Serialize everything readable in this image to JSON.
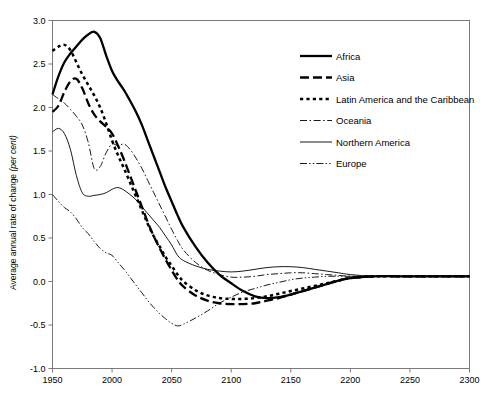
{
  "chart_data": {
    "type": "line",
    "title": "",
    "subtitle": "",
    "xlabel": "",
    "ylabel": "Average annual rate of change (per cent)",
    "ylabel_plain": "Average annual rate of change",
    "ylabel_italic": "(per cent)",
    "xlim": [
      1950,
      2300
    ],
    "ylim": [
      -1.0,
      3.0
    ],
    "grid": false,
    "legend_position": "top-right",
    "x_ticks": [
      1950,
      2000,
      2050,
      2100,
      2150,
      2200,
      2250,
      2300
    ],
    "x_tick_labels": [
      "1950",
      "2000",
      "2050",
      "2100",
      "2150",
      "2200",
      "2250",
      "2300"
    ],
    "y_ticks": [
      -1.0,
      -0.5,
      0.0,
      0.5,
      1.0,
      1.5,
      2.0,
      2.5,
      3.0
    ],
    "y_tick_labels": [
      "-1.0",
      "-0.5",
      "0.0",
      "0.5",
      "1.0",
      "1.5",
      "2.0",
      "2.5",
      "3.0"
    ],
    "x": [
      1950,
      1955,
      1960,
      1965,
      1970,
      1975,
      1980,
      1985,
      1990,
      1995,
      2000,
      2005,
      2010,
      2015,
      2020,
      2025,
      2030,
      2035,
      2040,
      2045,
      2050,
      2055,
      2060,
      2070,
      2080,
      2090,
      2100,
      2110,
      2120,
      2130,
      2140,
      2150,
      2160,
      2170,
      2180,
      2190,
      2200,
      2220,
      2240,
      2260,
      2280,
      2300
    ],
    "series": [
      {
        "name": "Africa",
        "style": "solid-thick",
        "values": [
          2.15,
          2.36,
          2.52,
          2.62,
          2.7,
          2.78,
          2.84,
          2.87,
          2.8,
          2.6,
          2.42,
          2.3,
          2.2,
          2.08,
          1.95,
          1.8,
          1.62,
          1.44,
          1.26,
          1.08,
          0.92,
          0.76,
          0.62,
          0.4,
          0.22,
          0.08,
          -0.02,
          -0.11,
          -0.17,
          -0.19,
          -0.18,
          -0.15,
          -0.11,
          -0.07,
          -0.03,
          0.01,
          0.04,
          0.06,
          0.06,
          0.06,
          0.06,
          0.06
        ]
      },
      {
        "name": "Asia",
        "style": "dashed-thick",
        "values": [
          1.95,
          2.02,
          2.18,
          2.3,
          2.33,
          2.22,
          2.05,
          1.92,
          1.84,
          1.78,
          1.7,
          1.56,
          1.4,
          1.22,
          1.04,
          0.86,
          0.68,
          0.52,
          0.38,
          0.25,
          0.13,
          0.02,
          -0.06,
          -0.16,
          -0.22,
          -0.25,
          -0.26,
          -0.26,
          -0.25,
          -0.22,
          -0.19,
          -0.15,
          -0.11,
          -0.07,
          -0.03,
          0.01,
          0.04,
          0.06,
          0.06,
          0.06,
          0.06,
          0.06
        ]
      },
      {
        "name": "Latin America and the Caribbean",
        "style": "dotted-thick",
        "values": [
          2.65,
          2.7,
          2.72,
          2.66,
          2.52,
          2.38,
          2.26,
          2.14,
          2.0,
          1.82,
          1.62,
          1.45,
          1.3,
          1.14,
          0.98,
          0.82,
          0.66,
          0.52,
          0.4,
          0.28,
          0.18,
          0.08,
          0.0,
          -0.1,
          -0.16,
          -0.19,
          -0.2,
          -0.2,
          -0.19,
          -0.17,
          -0.14,
          -0.11,
          -0.08,
          -0.05,
          -0.02,
          0.01,
          0.04,
          0.06,
          0.06,
          0.06,
          0.06,
          0.06
        ]
      },
      {
        "name": "Oceania",
        "style": "dash-dot-thin",
        "values": [
          2.15,
          2.1,
          2.05,
          1.98,
          1.9,
          1.8,
          1.6,
          1.3,
          1.32,
          1.48,
          1.58,
          1.56,
          1.58,
          1.52,
          1.42,
          1.3,
          1.16,
          1.02,
          0.88,
          0.74,
          0.6,
          0.47,
          0.36,
          0.22,
          0.13,
          0.08,
          0.05,
          0.05,
          0.06,
          0.08,
          0.09,
          0.1,
          0.1,
          0.09,
          0.08,
          0.07,
          0.06,
          0.06,
          0.06,
          0.06,
          0.06,
          0.06
        ]
      },
      {
        "name": "Northern America",
        "style": "solid-thin",
        "values": [
          1.72,
          1.76,
          1.7,
          1.52,
          1.22,
          1.02,
          0.98,
          0.99,
          1.0,
          1.02,
          1.06,
          1.08,
          1.05,
          1.0,
          0.94,
          0.86,
          0.78,
          0.7,
          0.62,
          0.52,
          0.42,
          0.3,
          0.24,
          0.18,
          0.14,
          0.12,
          0.11,
          0.12,
          0.14,
          0.16,
          0.17,
          0.17,
          0.16,
          0.14,
          0.12,
          0.1,
          0.08,
          0.06,
          0.06,
          0.06,
          0.06,
          0.06
        ]
      },
      {
        "name": "Europe",
        "style": "dash-dot-dot-thin",
        "values": [
          1.0,
          0.92,
          0.85,
          0.8,
          0.72,
          0.62,
          0.55,
          0.46,
          0.38,
          0.33,
          0.3,
          0.22,
          0.14,
          0.05,
          -0.04,
          -0.13,
          -0.22,
          -0.3,
          -0.37,
          -0.43,
          -0.48,
          -0.51,
          -0.49,
          -0.42,
          -0.34,
          -0.25,
          -0.18,
          -0.12,
          -0.08,
          -0.04,
          -0.01,
          0.02,
          0.04,
          0.05,
          0.06,
          0.06,
          0.06,
          0.06,
          0.06,
          0.06,
          0.06,
          0.06
        ]
      }
    ],
    "legend_entries": [
      {
        "label": "Africa",
        "style": "solid-thick"
      },
      {
        "label": "Asia",
        "style": "dashed-thick"
      },
      {
        "label": "Latin America and the Caribbean",
        "style": "dotted-thick"
      },
      {
        "label": "Oceania",
        "style": "dash-dot-thin"
      },
      {
        "label": "Northern America",
        "style": "solid-thin"
      },
      {
        "label": "Europe",
        "style": "dash-dot-dot-thin"
      }
    ],
    "colors": {
      "series": "#000000",
      "axis": "#7a7a7a",
      "background": "#ffffff"
    }
  }
}
